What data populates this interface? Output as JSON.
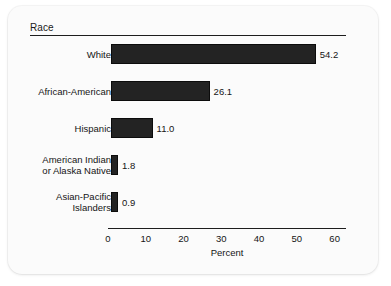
{
  "chart_data": {
    "type": "bar",
    "orientation": "horizontal",
    "title": "Race",
    "xlabel": "Percent",
    "ylabel": "",
    "categories": [
      "White",
      "African-American",
      "Hispanic",
      "American Indian\nor Alaska Native",
      "Asian-Pacific\nIslanders"
    ],
    "values": [
      54.2,
      26.1,
      11.0,
      1.8,
      0.9
    ],
    "value_labels": [
      "54.2",
      "26.1",
      "11.0",
      "1.8",
      "0.9"
    ],
    "xlim": [
      0,
      63
    ],
    "xticks": [
      0,
      10,
      20,
      30,
      40,
      50,
      60
    ],
    "xtick_labels": [
      "0",
      "10",
      "20",
      "30",
      "40",
      "50",
      "60"
    ],
    "grid": false,
    "legend": false,
    "bar_color": "#232323",
    "background_color": "#fbfbfb",
    "axis_color": "#1d1d1d"
  }
}
